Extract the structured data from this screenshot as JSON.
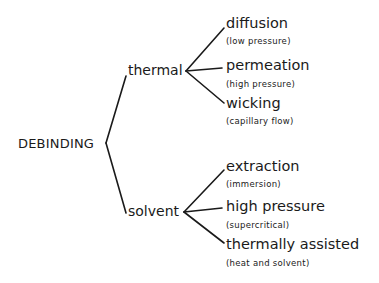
{
  "diagram": {
    "root": {
      "label": "DEBINDING"
    },
    "branches": [
      {
        "label": "thermal",
        "children": [
          {
            "label": "diffusion",
            "note": "(low pressure)"
          },
          {
            "label": "permeation",
            "note": "(high pressure)"
          },
          {
            "label": "wicking",
            "note": "(capillary flow)"
          }
        ]
      },
      {
        "label": "solvent",
        "children": [
          {
            "label": "extraction",
            "note": "(immersion)"
          },
          {
            "label": "high pressure",
            "note": "(supercritical)"
          },
          {
            "label": "thermally assisted",
            "note": "(heat and solvent)"
          }
        ]
      }
    ],
    "colors": {
      "line": "#1a1a1a",
      "text": "#1a1a1a",
      "background": "#ffffff"
    }
  }
}
